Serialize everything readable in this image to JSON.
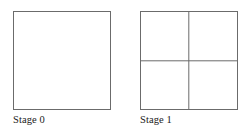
{
  "figure": {
    "background_color": "#ffffff",
    "line_color": "#6b6b6b",
    "text_color": "#1b1b1b",
    "stages": [
      {
        "label": "Stage 0",
        "shape": "square",
        "subdivisions": 1,
        "has_vertical_divider": false,
        "has_horizontal_divider": false
      },
      {
        "label": "Stage 1",
        "shape": "square",
        "subdivisions": 4,
        "has_vertical_divider": true,
        "has_horizontal_divider": true
      }
    ]
  }
}
